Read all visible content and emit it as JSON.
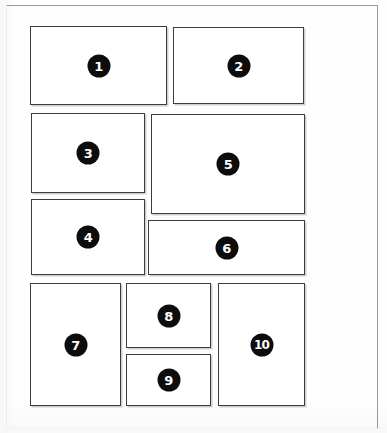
{
  "diagram": {
    "canvas": {
      "width": 387,
      "height": 433
    },
    "frame": {
      "x": 6,
      "y": 5,
      "width": 372,
      "height": 424,
      "color": "#9b9b9b"
    },
    "style": {
      "panel_border_color": "#3c3c3c",
      "panel_fill": "#ffffff",
      "badge_fill": "#0d0d0d",
      "badge_text_color": "#ffffff",
      "background": "#fefefe"
    },
    "panels": [
      {
        "label": "1",
        "x": 30,
        "y": 26,
        "width": 137,
        "height": 79
      },
      {
        "label": "2",
        "x": 173,
        "y": 27,
        "width": 131,
        "height": 77
      },
      {
        "label": "3",
        "x": 31,
        "y": 113,
        "width": 114,
        "height": 80
      },
      {
        "label": "4",
        "x": 31,
        "y": 199,
        "width": 114,
        "height": 76
      },
      {
        "label": "5",
        "x": 151,
        "y": 114,
        "width": 154,
        "height": 100
      },
      {
        "label": "6",
        "x": 148,
        "y": 220,
        "width": 157,
        "height": 55
      },
      {
        "label": "7",
        "x": 30,
        "y": 283,
        "width": 91,
        "height": 123
      },
      {
        "label": "8",
        "x": 126,
        "y": 283,
        "width": 85,
        "height": 65
      },
      {
        "label": "9",
        "x": 126,
        "y": 354,
        "width": 85,
        "height": 52
      },
      {
        "label": "10",
        "x": 218,
        "y": 283,
        "width": 87,
        "height": 123
      }
    ]
  }
}
